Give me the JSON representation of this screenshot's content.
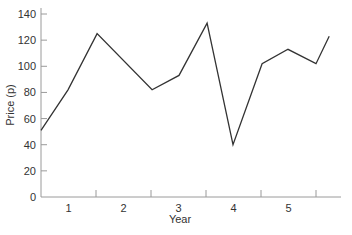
{
  "chart_data": {
    "type": "line",
    "title": "",
    "xlabel": "Year",
    "ylabel": "Price (p)",
    "ylim": [
      0,
      140
    ],
    "xlim": [
      0,
      5.45
    ],
    "grid": false,
    "legend": null,
    "y_ticks": [
      0,
      20,
      40,
      60,
      80,
      100,
      120,
      140
    ],
    "x_tick_marks": [
      1,
      2,
      3,
      4,
      5
    ],
    "x_tick_labels": [
      {
        "label": "1",
        "pos": 0.5
      },
      {
        "label": "2",
        "pos": 1.5
      },
      {
        "label": "3",
        "pos": 2.5
      },
      {
        "label": "4",
        "pos": 3.5
      },
      {
        "label": "5",
        "pos": 4.5
      }
    ],
    "series": [
      {
        "name": "Price",
        "color": "#333333",
        "x": [
          0,
          0.49,
          1.02,
          2.02,
          2.51,
          3.02,
          3.49,
          4.02,
          4.49,
          5.0,
          5.24
        ],
        "values": [
          51,
          82,
          125,
          82,
          93,
          133,
          40,
          102,
          113,
          102,
          123
        ]
      }
    ]
  },
  "colors": {
    "axis": "#9a9a9a",
    "line": "#333333",
    "text": "#333333"
  }
}
